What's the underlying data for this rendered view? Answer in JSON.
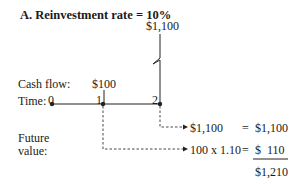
{
  "diagram": {
    "title": "A.  Reinvestment rate = 10%",
    "top_cash_flow": "$1,100",
    "labels": {
      "cash_flow": "Cash flow:",
      "time": "Time:",
      "future_value_line1": "Future",
      "future_value_line2": "value:"
    },
    "time_points": [
      "0",
      "1",
      "2"
    ],
    "cash_flow_at_1": "$100",
    "rows": [
      {
        "expression": "$1,100",
        "equals": "=",
        "value": "$1,100"
      },
      {
        "expression": "100 x 1.10",
        "equals": "=",
        "value": "$  110"
      }
    ],
    "total": "$1,210"
  }
}
